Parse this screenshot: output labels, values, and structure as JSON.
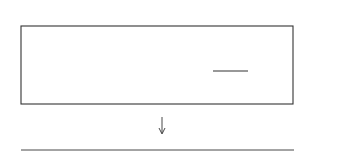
{
  "diagram": {
    "type": "fibration-diagram",
    "total_space": {
      "label": "M",
      "rect": {
        "x": 21,
        "y": 26,
        "w": 272,
        "h": 78
      }
    },
    "base_space": {
      "label": "ℂP",
      "label_subscript": "1",
      "line": {
        "x1": 21,
        "x2": 294,
        "y": 150
      }
    },
    "projection_arrow": {
      "x": 162,
      "y1": 117,
      "y2": 134
    },
    "fibers_x": [
      46,
      89,
      125,
      162,
      205,
      249
    ],
    "base_points_x": [
      46,
      89,
      125,
      162,
      205,
      249
    ],
    "labels": {
      "top_self_intersection": "−3",
      "bottom_self_intersection": "−3",
      "left_component": "0",
      "col2_top": "−2",
      "col2_middle": "−1",
      "col2_bottom": "−2",
      "col5_top": "−2",
      "col5_middle": "−2",
      "col5_bottom": "−2",
      "col5_branch": "−1"
    }
  }
}
